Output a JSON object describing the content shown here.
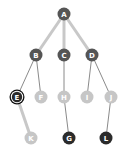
{
  "diagram": {
    "type": "tree",
    "colors": {
      "dark_node": "#555555",
      "light_node": "#c6c6c6",
      "darkest_node": "#2b2b2b",
      "highlight_edge": "#c8c8c8",
      "normal_edge": "#8a8a8a"
    },
    "nodes": [
      {
        "id": "A",
        "label": "A",
        "x": 64,
        "y": 14,
        "style": "dark"
      },
      {
        "id": "B",
        "label": "B",
        "x": 36,
        "y": 55,
        "style": "dark"
      },
      {
        "id": "C",
        "label": "C",
        "x": 64,
        "y": 55,
        "style": "dark"
      },
      {
        "id": "D",
        "label": "D",
        "x": 92,
        "y": 55,
        "style": "dark"
      },
      {
        "id": "E",
        "label": "E",
        "x": 17,
        "y": 97,
        "style": "selected"
      },
      {
        "id": "F",
        "label": "F",
        "x": 41,
        "y": 97,
        "style": "light"
      },
      {
        "id": "H",
        "label": "H",
        "x": 64,
        "y": 97,
        "style": "light"
      },
      {
        "id": "I",
        "label": "I",
        "x": 87,
        "y": 97,
        "style": "light"
      },
      {
        "id": "J",
        "label": "J",
        "x": 111,
        "y": 97,
        "style": "light"
      },
      {
        "id": "K",
        "label": "K",
        "x": 31,
        "y": 138,
        "style": "light"
      },
      {
        "id": "G",
        "label": "G",
        "x": 69,
        "y": 138,
        "style": "darkest"
      },
      {
        "id": "L",
        "label": "L",
        "x": 106,
        "y": 138,
        "style": "darkest"
      }
    ],
    "edges": [
      {
        "from": "A",
        "to": "B",
        "style": "thick"
      },
      {
        "from": "A",
        "to": "C",
        "style": "thick"
      },
      {
        "from": "A",
        "to": "D",
        "style": "thick"
      },
      {
        "from": "B",
        "to": "E",
        "style": "normal"
      },
      {
        "from": "B",
        "to": "F",
        "style": "normal"
      },
      {
        "from": "C",
        "to": "H",
        "style": "normal"
      },
      {
        "from": "D",
        "to": "I",
        "style": "normal"
      },
      {
        "from": "D",
        "to": "J",
        "style": "normal"
      },
      {
        "from": "E",
        "to": "K",
        "style": "thick"
      },
      {
        "from": "H",
        "to": "G",
        "style": "normal"
      },
      {
        "from": "J",
        "to": "L",
        "style": "normal"
      }
    ]
  }
}
